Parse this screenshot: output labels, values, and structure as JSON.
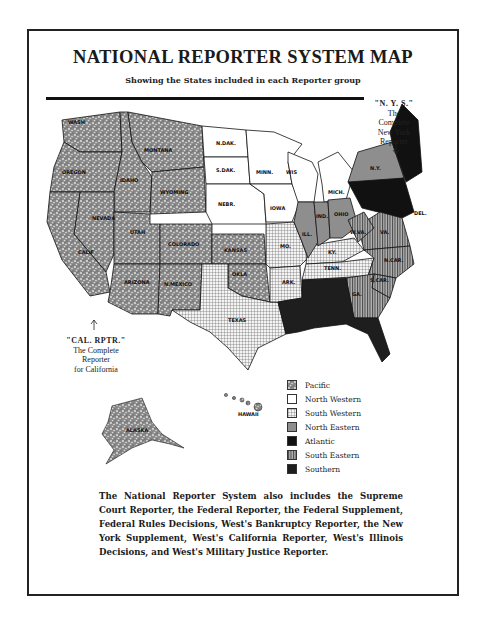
{
  "title": "NATIONAL REPORTER SYSTEM MAP",
  "subtitle": "Showing the States included in each Reporter group",
  "callouts": {
    "nys": {
      "line1": "\"N. Y. S.\"",
      "line2": "The",
      "line3": "Complete",
      "line4": "New York",
      "line5": "Reporter"
    },
    "cal": {
      "line1": "\"CAL. RPTR.\"",
      "line2": "The Complete",
      "line3": "Reporter",
      "line4": "for California"
    }
  },
  "legend": [
    {
      "label": "Pacific",
      "pattern": "speckled-dark",
      "color": "#7a7a7a"
    },
    {
      "label": "North Western",
      "pattern": "white",
      "color": "#ffffff"
    },
    {
      "label": "South Western",
      "pattern": "grid",
      "color": "#d8d8d8"
    },
    {
      "label": "North Eastern",
      "pattern": "solid-gray",
      "color": "#8e8e8e"
    },
    {
      "label": "Atlantic",
      "pattern": "solid-black",
      "color": "#111111"
    },
    {
      "label": "South Eastern",
      "pattern": "vertical-stripes",
      "color": "#9a9a9a"
    },
    {
      "label": "Southern",
      "pattern": "solid-dark",
      "color": "#1e1e1e"
    }
  ],
  "states": {
    "wash": "WASH",
    "oregon": "OREGON",
    "idaho": "IDAHO",
    "montana": "MONTANA",
    "wyoming": "WYOMING",
    "nevada": "NEVADA",
    "calif": "CALIF",
    "utah": "UTAH",
    "colorado": "COLORADO",
    "arizona": "ARIZONA",
    "nmexico": "N.MEXICO",
    "ndak": "N.DAK.",
    "sdak": "S.DAK.",
    "nebr": "NEBR.",
    "minn": "MINN.",
    "iowa": "IOWA",
    "wis": "WIS",
    "mich": "MICH.",
    "kansas": "KANSAS",
    "okla": "OKLA",
    "texas": "TEXAS",
    "mo": "MO.",
    "ark": "ARK.",
    "ill": "ILL.",
    "ind": "IND.",
    "ohio": "OHIO",
    "ky": "KY.",
    "tenn": "TENN.",
    "wva": "W.VA.",
    "va": "VA.",
    "ncar": "N.CAR.",
    "scar": "S.CAR.",
    "ga": "GA.",
    "ny": "N.Y.",
    "del": "DEL.",
    "alaska": "ALASKA",
    "hawaii": "HAWAII"
  },
  "footnote": "The National Reporter System also includes the Supreme Court Reporter, the Federal Reporter, the Federal Supplement, Federal Rules Decisions, West's Bankruptcy Reporter, the New York Supplement, West's California Reporter, West's Illinois Decisions, and West's Military Justice Reporter."
}
